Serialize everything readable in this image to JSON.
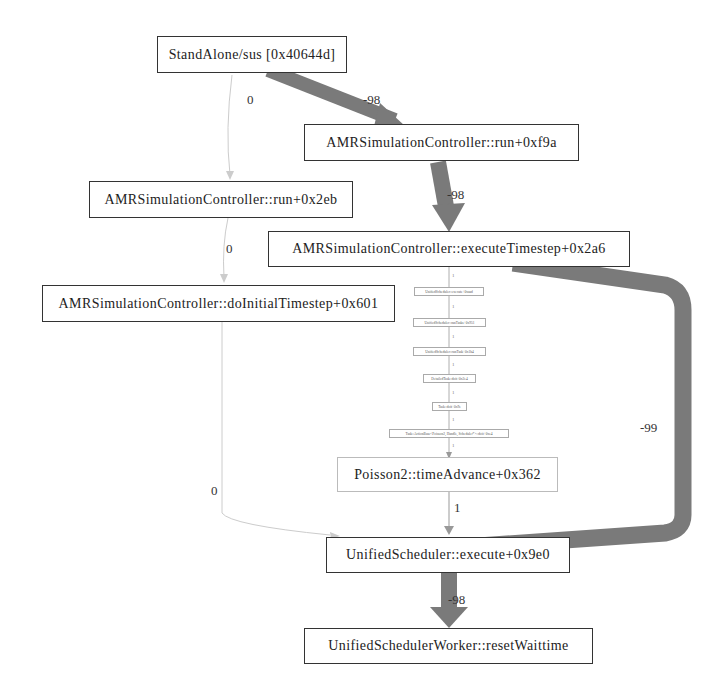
{
  "graph": {
    "nodes": [
      {
        "id": "n0",
        "label": "StandAlone/sus [0x40644d]"
      },
      {
        "id": "n1",
        "label": "AMRSimulationController::run+0xf9a"
      },
      {
        "id": "n2",
        "label": "AMRSimulationController::run+0x2eb"
      },
      {
        "id": "n3",
        "label": "AMRSimulationController::executeTimestep+0x2a6"
      },
      {
        "id": "n4",
        "label": "AMRSimulationController::doInitialTimestep+0x601"
      },
      {
        "id": "n5",
        "label": "UnifiedScheduler::execute+0xaad"
      },
      {
        "id": "n6",
        "label": "UnifiedScheduler::runTasks+0x951"
      },
      {
        "id": "n7",
        "label": "UnifiedScheduler::runTask+0x1b4"
      },
      {
        "id": "n8",
        "label": "DetailedTask::doit+0x2e4"
      },
      {
        "id": "n9",
        "label": "Task::doit+0x9e"
      },
      {
        "id": "n10",
        "label": "Task::ActionBase<Poisson2, Handle, Scheduler*>::doit+0xe4"
      },
      {
        "id": "n11",
        "label": "Poisson2::timeAdvance+0x362"
      },
      {
        "id": "n12",
        "label": "UnifiedScheduler::execute+0x9e0"
      },
      {
        "id": "n13",
        "label": "UnifiedSchedulerWorker::resetWaittime"
      }
    ],
    "edges": [
      {
        "from": "n0",
        "to": "n1",
        "label": "-98",
        "weight": "heavy"
      },
      {
        "from": "n0",
        "to": "n2",
        "label": "0",
        "weight": "faint"
      },
      {
        "from": "n1",
        "to": "n3",
        "label": "-98",
        "weight": "heavy"
      },
      {
        "from": "n2",
        "to": "n4",
        "label": "0",
        "weight": "faint"
      },
      {
        "from": "n3",
        "to": "n5",
        "label": "1",
        "weight": "thin"
      },
      {
        "from": "n5",
        "to": "n6",
        "label": "1",
        "weight": "thin"
      },
      {
        "from": "n6",
        "to": "n7",
        "label": "1",
        "weight": "thin"
      },
      {
        "from": "n7",
        "to": "n8",
        "label": "1",
        "weight": "thin"
      },
      {
        "from": "n8",
        "to": "n9",
        "label": "1",
        "weight": "thin"
      },
      {
        "from": "n9",
        "to": "n10",
        "label": "1",
        "weight": "thin"
      },
      {
        "from": "n10",
        "to": "n11",
        "label": "1",
        "weight": "thin"
      },
      {
        "from": "n11",
        "to": "n12",
        "label": "1",
        "weight": "thin"
      },
      {
        "from": "n3",
        "to": "n12",
        "label": "-99",
        "weight": "heavy"
      },
      {
        "from": "n4",
        "to": "n12",
        "label": "0",
        "weight": "faint"
      },
      {
        "from": "n12",
        "to": "n13",
        "label": "-98",
        "weight": "heavy"
      }
    ]
  },
  "colors": {
    "heavy_edge": "#7a7a7a",
    "thin_edge": "#999999",
    "faint_edge": "#cccccc",
    "node_border": "#333333"
  }
}
